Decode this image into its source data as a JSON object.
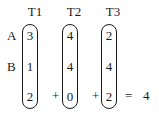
{
  "headers": [
    "T1",
    "T2",
    "T3"
  ],
  "row_labels": [
    "A",
    "B"
  ],
  "columns": [
    {
      "name": "T1",
      "values": [
        "3",
        "1",
        "2"
      ]
    },
    {
      "name": "T2",
      "values": [
        "4",
        "4",
        "0"
      ]
    },
    {
      "name": "T3",
      "values": [
        "2",
        "4",
        "2"
      ]
    }
  ],
  "operators": {
    "plus1": "+",
    "plus2": "+",
    "equals": "="
  },
  "result": "4"
}
